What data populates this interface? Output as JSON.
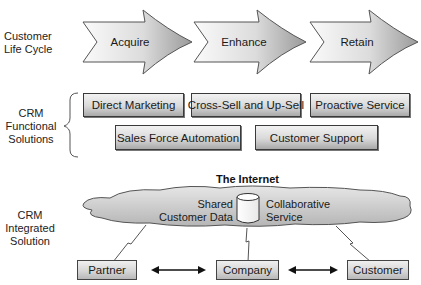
{
  "life_cycle": {
    "row_label": "Customer\nLife Cycle",
    "stages": [
      {
        "label": "Acquire"
      },
      {
        "label": "Enhance"
      },
      {
        "label": "Retain"
      }
    ]
  },
  "functional": {
    "row_label": "CRM\nFunctional\nSolutions",
    "solutions_row1": [
      {
        "label": "Direct Marketing"
      },
      {
        "label": "Cross-Sell and Up-Sell"
      },
      {
        "label": "Proactive Service"
      }
    ],
    "solutions_row2": [
      {
        "label": "Sales Force Automation"
      },
      {
        "label": "Customer Support"
      }
    ]
  },
  "integrated": {
    "row_label": "CRM\nIntegrated\nSolution",
    "cloud_title": "The Internet",
    "shared_data_label": "Shared\nCustomer Data",
    "collab_label": "Collaborative\nService",
    "nodes": [
      {
        "label": "Partner"
      },
      {
        "label": "Company"
      },
      {
        "label": "Customer"
      }
    ]
  },
  "colors": {
    "border": "#3a3a3a",
    "fill_light": "#f2f2f2",
    "fill_dark": "#a9a9a9",
    "cloud_fill": "#c8c8c8"
  }
}
